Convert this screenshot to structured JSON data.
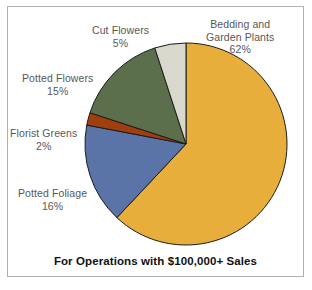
{
  "chart_data": {
    "type": "pie",
    "title": "",
    "caption": "For Operations with $100,000+ Sales",
    "xlabel": "",
    "ylabel": "",
    "legend_position": "none",
    "labels_placement": "outside-callout",
    "start_angle_deg": 0,
    "direction": "clockwise",
    "categories": [
      "Bedding and Garden Plants",
      "Potted Foliage",
      "Florist Greens",
      "Potted Flowers",
      "Cut Flowers"
    ],
    "values": [
      62,
      16,
      2,
      15,
      5
    ],
    "value_unit": "%",
    "colors": [
      "#e8ae3c",
      "#5a74a8",
      "#a03e10",
      "#5c6f4c",
      "#d8d8cc"
    ],
    "slice_border_color": "#1b1b1b",
    "slices": [
      {
        "name": "Bedding and Garden Plants",
        "label_line1": "Bedding and",
        "label_line2": "Garden Plants",
        "value": 62,
        "value_label": "62%",
        "color": "#e8ae3c"
      },
      {
        "name": "Potted Foliage",
        "label_line1": "Potted Foliage",
        "label_line2": "",
        "value": 16,
        "value_label": "16%",
        "color": "#5a74a8"
      },
      {
        "name": "Florist Greens",
        "label_line1": "Florist Greens",
        "label_line2": "",
        "value": 2,
        "value_label": "2%",
        "color": "#a03e10"
      },
      {
        "name": "Potted Flowers",
        "label_line1": "Potted Flowers",
        "label_line2": "",
        "value": 15,
        "value_label": "15%",
        "color": "#5c6f4c"
      },
      {
        "name": "Cut Flowers",
        "label_line1": "Cut Flowers",
        "label_line2": "",
        "value": 5,
        "value_label": "5%",
        "color": "#d8d8cc"
      }
    ]
  },
  "figure": {
    "caption": "For Operations with $100,000+ Sales",
    "border_color": "#b0b0b0",
    "background": "#ffffff",
    "label_color": "#575757"
  }
}
